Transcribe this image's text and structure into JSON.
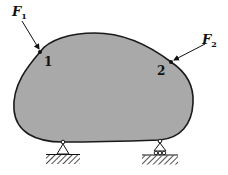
{
  "diagram": {
    "type": "rigid body with applied forces and supports",
    "body": {
      "fill": "#a9a9a9",
      "stroke": "#1a1a1a"
    },
    "forces": [
      {
        "symbol": "F",
        "subscript": "1",
        "label": "F1"
      },
      {
        "symbol": "F",
        "subscript": "2",
        "label": "F2"
      }
    ],
    "points": [
      {
        "label": "1"
      },
      {
        "label": "2"
      }
    ],
    "supports": [
      {
        "type": "pin",
        "position": "bottom-left"
      },
      {
        "type": "roller",
        "position": "bottom-right"
      }
    ]
  }
}
